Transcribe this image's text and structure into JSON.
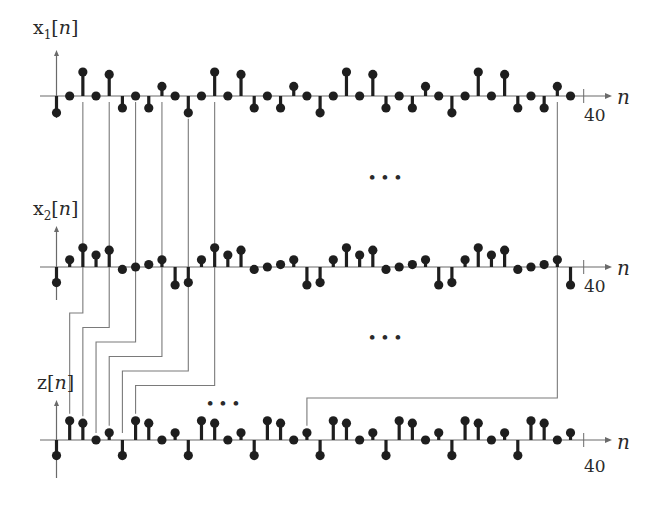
{
  "colors": {
    "ink": "#1e1e1e",
    "axis": "#6a6a6a",
    "route": "#7a7a7a"
  },
  "signals": [
    {
      "id": "x1",
      "label_base": "x",
      "label_sub": "1",
      "label_arg": "n",
      "axis_var": "n",
      "end_tick_label": "40",
      "values": [
        -1.4,
        0,
        2,
        0,
        1.8,
        -1,
        0,
        -1,
        0.8,
        0,
        -1.4,
        0,
        2,
        0,
        1.8,
        -1,
        0,
        -1,
        0.8,
        0,
        -1.4,
        0,
        2,
        0,
        1.8,
        -1,
        0,
        -1,
        0.8,
        0,
        -1.4,
        0,
        2,
        0,
        1.8,
        -1,
        0,
        -1,
        0.8,
        0
      ]
    },
    {
      "id": "x2",
      "label_base": "x",
      "label_sub": "2",
      "label_arg": "n",
      "axis_var": "n",
      "end_tick_label": "40",
      "values": [
        -1.3,
        0.6,
        1.6,
        1.0,
        1.4,
        -0.2,
        0,
        0.2,
        0.6,
        -1.5,
        -1.3,
        0.6,
        1.6,
        1.0,
        1.4,
        -0.2,
        0,
        0.2,
        0.6,
        -1.5,
        -1.3,
        0.6,
        1.6,
        1.0,
        1.4,
        -0.2,
        0,
        0.2,
        0.6,
        -1.5,
        -1.3,
        0.6,
        1.6,
        1.0,
        1.4,
        -0.2,
        0,
        0.2,
        0.6,
        -1.5
      ]
    },
    {
      "id": "z",
      "label_base": "z",
      "label_sub": "",
      "label_arg": "n",
      "axis_var": "n",
      "end_tick_label": "40",
      "values": [
        -1.3,
        1.6,
        1.4,
        0,
        0.6,
        -1.3,
        1.6,
        1.4,
        0,
        0.6,
        -1.3,
        1.6,
        1.4,
        0,
        0.6,
        -1.3,
        1.6,
        1.4,
        0,
        0.6,
        -1.3,
        1.6,
        1.4,
        0,
        0.6,
        -1.3,
        1.6,
        1.4,
        0,
        0.6,
        -1.3,
        1.6,
        1.4,
        0,
        0.6,
        -1.3,
        1.6,
        1.4,
        0,
        0.6
      ]
    }
  ],
  "connections": [
    {
      "from_n": 2,
      "to_n": 1
    },
    {
      "from_n": 4,
      "to_n": 2
    },
    {
      "from_n": 6,
      "to_n": 3
    },
    {
      "from_n": 8,
      "to_n": 4
    },
    {
      "from_n": 10,
      "to_n": 5
    },
    {
      "from_n": 12,
      "to_n": 6
    },
    {
      "from_n": 38,
      "to_n": 19
    }
  ],
  "ellipses": [
    {
      "id": "ellipsis-x1-x2",
      "text": "• • •"
    },
    {
      "id": "ellipsis-x2-z",
      "text": "• • •"
    },
    {
      "id": "ellipsis-z",
      "text": "• • •"
    }
  ]
}
